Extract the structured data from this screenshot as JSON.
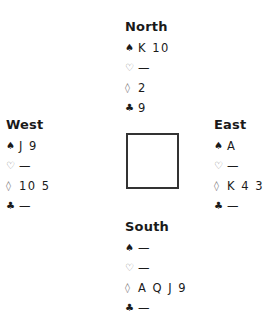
{
  "hands": {
    "north": {
      "name": "North",
      "spades": "K 10",
      "hearts": "—",
      "diamonds": "2",
      "clubs": "9"
    },
    "west": {
      "name": "West",
      "spades": "J 9",
      "hearts": "—",
      "diamonds": "10 5",
      "clubs": "—"
    },
    "east": {
      "name": "East",
      "spades": "A",
      "hearts": "—",
      "diamonds": "K 4 3",
      "clubs": "—"
    },
    "south": {
      "name": "South",
      "spades": "—",
      "hearts": "—",
      "diamonds": "A Q J 9",
      "clubs": "—"
    }
  },
  "suits": {
    "spades": "♠",
    "hearts": "♡",
    "diamonds": "◊",
    "clubs": "♣"
  }
}
